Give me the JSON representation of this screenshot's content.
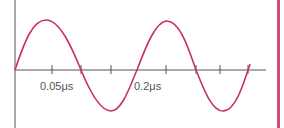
{
  "diagram": {
    "type": "sine-waveform",
    "labels": [
      {
        "text": "0.05μs",
        "x": 40,
        "y": 85
      },
      {
        "text": "0.2μs",
        "x": 133,
        "y": 85
      }
    ],
    "colors": {
      "wave": "#c8325a",
      "axis": "#555555",
      "border": "#d04a72"
    },
    "cycles": 2
  }
}
